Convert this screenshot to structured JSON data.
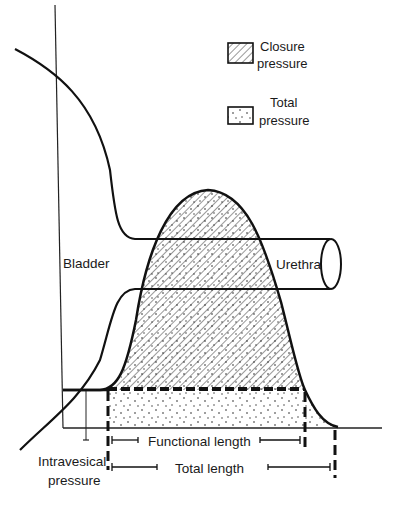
{
  "diagram": {
    "legend": {
      "items": [
        {
          "key": "closure",
          "line1": "Closure",
          "line2": "pressure",
          "pattern": "diagonal-hatch"
        },
        {
          "key": "total",
          "line1": "Total",
          "line2": "pressure",
          "pattern": "stipple"
        }
      ]
    },
    "labels": {
      "bladder": "Bladder",
      "urethra": "Urethra",
      "intravesical_line1": "Intravesical",
      "intravesical_line2": "pressure",
      "functional_length": "Functional length",
      "total_length": "Total length"
    },
    "colors": {
      "ink": "#111111",
      "background": "#ffffff",
      "hatch": "#333333",
      "stipple": "#222222"
    }
  }
}
